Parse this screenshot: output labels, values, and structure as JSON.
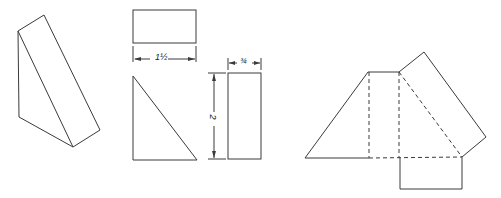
{
  "figure": {
    "line_color": "#3a3a3a",
    "background": "#ffffff"
  },
  "dimensions": {
    "width_label": "1½",
    "depth_label": "¾",
    "height_label": "2"
  },
  "views": [
    {
      "name": "pictorial",
      "label": "isometric triangular prism"
    },
    {
      "name": "top-view",
      "label": "top view rectangle"
    },
    {
      "name": "front-view",
      "label": "front view right triangle"
    },
    {
      "name": "side-view",
      "label": "side view rectangle"
    },
    {
      "name": "development",
      "label": "unfolded net with fold lines"
    }
  ]
}
